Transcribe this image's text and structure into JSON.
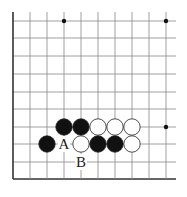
{
  "diagram": {
    "type": "go-board-fragment",
    "grid": {
      "x_lines": [
        13,
        30,
        47,
        64,
        81,
        98,
        115,
        132,
        149,
        166
      ],
      "y_lines": [
        21,
        38,
        56,
        74,
        92,
        109,
        127,
        144,
        162,
        179
      ],
      "right_extent": 176,
      "top_extent": 12,
      "line_color": "#888888",
      "edge_color": "#333333"
    },
    "star_points": [
      [
        64,
        21
      ],
      [
        166,
        21
      ],
      [
        166,
        127
      ]
    ],
    "stones": [
      {
        "color": "black",
        "x": 64,
        "y": 127
      },
      {
        "color": "black",
        "x": 81,
        "y": 127
      },
      {
        "color": "white",
        "x": 98,
        "y": 127
      },
      {
        "color": "white",
        "x": 115,
        "y": 127
      },
      {
        "color": "white",
        "x": 132,
        "y": 127
      },
      {
        "color": "black",
        "x": 47,
        "y": 144
      },
      {
        "color": "white",
        "x": 81,
        "y": 144
      },
      {
        "color": "black",
        "x": 98,
        "y": 144
      },
      {
        "color": "black",
        "x": 115,
        "y": 144
      },
      {
        "color": "white",
        "x": 132,
        "y": 144
      }
    ],
    "labels": [
      {
        "text": "A",
        "x": 64,
        "y": 144
      },
      {
        "text": "B",
        "x": 81,
        "y": 162
      }
    ]
  }
}
